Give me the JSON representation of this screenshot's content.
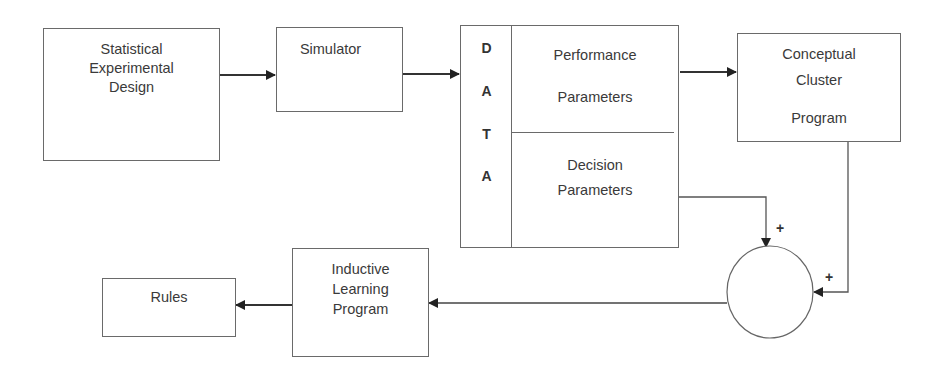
{
  "diagram": {
    "nodes": {
      "experimental_design": {
        "label": "Statistical\nExperimental\nDesign"
      },
      "simulator": {
        "label": "Simulator"
      },
      "data": {
        "side_letters": [
          "D",
          "A",
          "T",
          "A"
        ],
        "performance": {
          "line1": "Performance",
          "line2": "Parameters"
        },
        "decision": {
          "label": "Decision\nParameters"
        }
      },
      "cluster": {
        "line1": "Conceptual",
        "line2": "Cluster",
        "line3": "Program"
      },
      "summing_junction": {
        "label": ""
      },
      "inductive": {
        "label": "Inductive\nLearning\nProgram"
      },
      "rules": {
        "label": "Rules"
      }
    },
    "signs": {
      "decision_input": "+",
      "cluster_input": "+"
    },
    "edges": [
      {
        "from": "Statistical Experimental Design",
        "to": "Simulator"
      },
      {
        "from": "Simulator",
        "to": "DATA"
      },
      {
        "from": "Performance Parameters",
        "to": "Conceptual Cluster Program"
      },
      {
        "from": "Decision Parameters",
        "to": "summing junction",
        "sign": "+"
      },
      {
        "from": "Conceptual Cluster Program",
        "to": "summing junction",
        "sign": "+"
      },
      {
        "from": "summing junction",
        "to": "Inductive Learning Program"
      },
      {
        "from": "Inductive Learning Program",
        "to": "Rules"
      }
    ],
    "colors": {
      "line": "#2a2a2a",
      "border": "#6a6a6a",
      "text": "#3a3a3a"
    }
  }
}
